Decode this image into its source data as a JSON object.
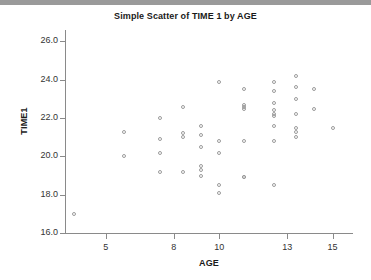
{
  "window": {
    "top_bar_color": "#9a9a9a"
  },
  "chart_data": {
    "type": "scatter",
    "title": "Simple Scatter of TIME 1 by AGE",
    "xlabel": "AGE",
    "ylabel": "TIME1",
    "xlim": [
      3.2,
      15.9
    ],
    "ylim": [
      16.0,
      26.6
    ],
    "xticks": [
      5,
      8,
      10,
      13,
      15
    ],
    "xtick_labels": [
      "5",
      "8",
      "10",
      "13",
      "15"
    ],
    "yticks": [
      16.0,
      18.0,
      20.0,
      22.0,
      24.0,
      26.0
    ],
    "ytick_labels": [
      "16.0",
      "18.0",
      "20.0",
      "22.0",
      "24.0",
      "26.0"
    ],
    "grid": false,
    "legend": null,
    "marker": "open-circle",
    "marker_color": "#9b9b9b",
    "series": [
      {
        "name": "TIME1 by AGE",
        "points": [
          [
            3.6,
            17.0
          ],
          [
            5.8,
            21.3
          ],
          [
            5.8,
            20.0
          ],
          [
            7.4,
            22.0
          ],
          [
            7.4,
            20.9
          ],
          [
            7.4,
            20.2
          ],
          [
            7.4,
            19.2
          ],
          [
            8.4,
            22.6
          ],
          [
            8.4,
            21.2
          ],
          [
            8.4,
            21.0
          ],
          [
            8.4,
            19.2
          ],
          [
            9.2,
            21.6
          ],
          [
            9.2,
            21.1
          ],
          [
            9.2,
            20.5
          ],
          [
            9.2,
            19.5
          ],
          [
            9.2,
            19.3
          ],
          [
            9.2,
            19.0
          ],
          [
            10.0,
            23.9
          ],
          [
            10.0,
            20.8
          ],
          [
            10.0,
            20.2
          ],
          [
            10.0,
            18.5
          ],
          [
            10.0,
            18.1
          ],
          [
            11.1,
            23.5
          ],
          [
            11.1,
            22.7
          ],
          [
            11.1,
            22.6
          ],
          [
            11.1,
            22.5
          ],
          [
            11.1,
            20.8
          ],
          [
            11.1,
            18.9
          ],
          [
            11.1,
            18.9
          ],
          [
            12.4,
            23.9
          ],
          [
            12.4,
            23.4
          ],
          [
            12.4,
            22.8
          ],
          [
            12.4,
            22.4
          ],
          [
            12.4,
            22.2
          ],
          [
            12.4,
            22.1
          ],
          [
            12.4,
            21.6
          ],
          [
            12.4,
            20.8
          ],
          [
            12.4,
            18.5
          ],
          [
            13.4,
            24.2
          ],
          [
            13.4,
            23.6
          ],
          [
            13.4,
            23.0
          ],
          [
            13.4,
            22.2
          ],
          [
            13.4,
            21.5
          ],
          [
            13.4,
            21.3
          ],
          [
            13.4,
            21.0
          ],
          [
            14.2,
            23.5
          ],
          [
            14.2,
            22.5
          ],
          [
            15.0,
            21.5
          ]
        ]
      }
    ]
  }
}
